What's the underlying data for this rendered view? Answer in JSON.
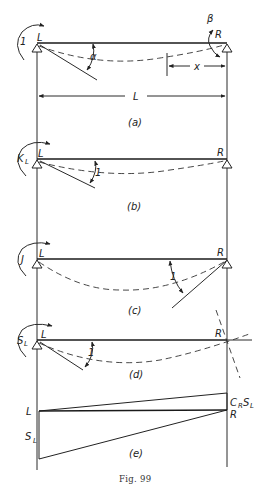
{
  "figure": {
    "caption": "Fig. 99",
    "span_label": "L",
    "panels": [
      {
        "id": "a",
        "label": "(a)",
        "left_support": "L",
        "right_support": "R",
        "applied_moment": "1",
        "left_rotation": "α",
        "right_rotation": "β",
        "distance_label": "x"
      },
      {
        "id": "b",
        "label": "(b)",
        "left_support": "L",
        "right_support": "R",
        "applied_moment": "K",
        "applied_moment_sub": "L",
        "rotation": "1"
      },
      {
        "id": "c",
        "label": "(c)",
        "left_support": "L",
        "right_support": "R",
        "applied_moment": "J",
        "rotation": "1"
      },
      {
        "id": "d",
        "label": "(d)",
        "left_support": "L",
        "right_support": "R",
        "applied_moment": "S",
        "applied_moment_sub": "L",
        "rotation": "1"
      },
      {
        "id": "e",
        "label": "(e)",
        "left_end": "L",
        "right_end": "R",
        "left_ordinate": "S",
        "left_ordinate_sub": "L",
        "right_ordinate_c": "C",
        "right_ordinate_c_sub": "R",
        "right_ordinate_s": "S",
        "right_ordinate_s_sub": "L"
      }
    ]
  }
}
